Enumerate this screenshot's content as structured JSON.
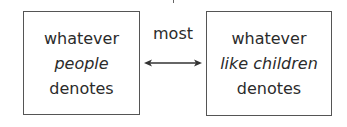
{
  "diagram": {
    "left_box": {
      "lines": [
        "whatever",
        "people",
        "denotes"
      ],
      "italic_line_index": 1
    },
    "right_box": {
      "lines": [
        "whatever",
        "like children",
        "denotes"
      ],
      "italic_line_index": 1
    },
    "relation": {
      "label": "most",
      "arrow": "bidirectional"
    }
  },
  "colors": {
    "border": "#555555",
    "text": "#2b2b2b",
    "background": "#ffffff"
  }
}
